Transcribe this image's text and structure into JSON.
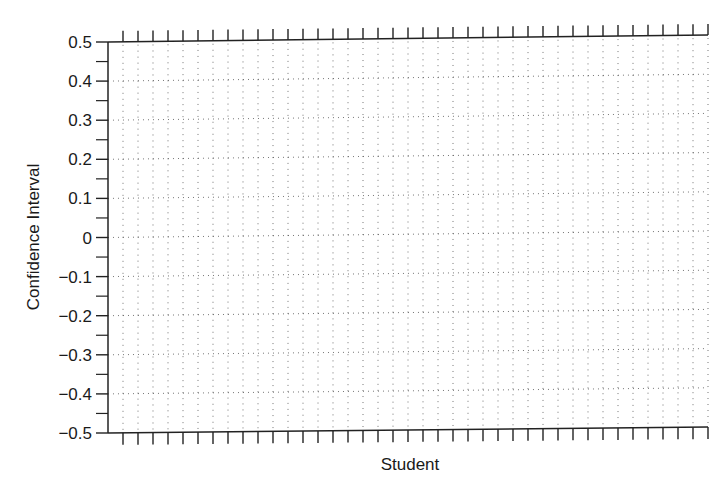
{
  "chart_data": {
    "type": "scatter",
    "title": "",
    "xlabel": "Student",
    "ylabel": "Confidence Interval",
    "ylim": [
      -0.5,
      0.5
    ],
    "yticks": [
      0.5,
      0.4,
      0.3,
      0.2,
      0.1,
      0,
      -0.1,
      -0.2,
      -0.3,
      -0.4,
      -0.5
    ],
    "ytick_labels": [
      "0.5",
      "0.4",
      "0.3",
      "0.2",
      "0.1",
      "0",
      "−0.1",
      "−0.2",
      "−0.3",
      "−0.4",
      "−0.5"
    ],
    "xticks_count": 40,
    "xtick_labels": [],
    "grid": true,
    "grid_style": "dotted",
    "series": [],
    "legend": null
  },
  "colors": {
    "axis": "#222222",
    "grid": "#555555",
    "text": "#1a1a1a"
  }
}
